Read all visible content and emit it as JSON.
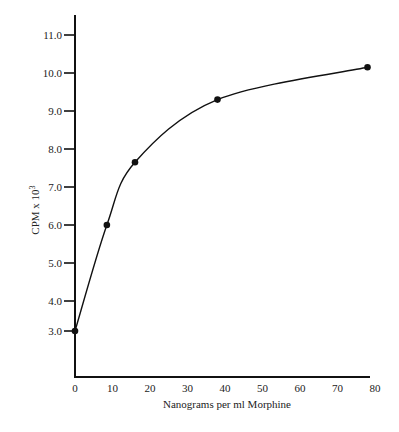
{
  "chart_data": {
    "type": "line",
    "title": "",
    "xlabel": "Nanograms per ml Morphine",
    "ylabel": "CPM x 10³",
    "ylabel_base": "CPM x 10",
    "ylabel_sup": "3",
    "xlim": [
      0,
      80
    ],
    "ylim": [
      3.0,
      11.5
    ],
    "x_ticks": [
      0,
      10,
      20,
      30,
      40,
      50,
      60,
      70,
      80
    ],
    "x_tick_labels": [
      "0",
      "10",
      "20",
      "30",
      "40",
      "50",
      "60",
      "70",
      "80"
    ],
    "y_ticks": [
      3.0,
      4.0,
      5.0,
      6.0,
      7.0,
      8.0,
      9.0,
      10.0,
      11.0
    ],
    "y_tick_labels": [
      "3.0",
      "4.0",
      "5.0",
      "6.0",
      "7.0",
      "8.0",
      "9.0",
      "10.0",
      "11.0"
    ],
    "grid": false,
    "legend": null,
    "series": [
      {
        "name": "Morphine standard curve",
        "style": "smooth curve with filled circle markers",
        "color": "#111111",
        "x": [
          0,
          8.5,
          16,
          38,
          78
        ],
        "y": [
          3.0,
          6.0,
          7.65,
          9.3,
          10.15
        ]
      }
    ]
  }
}
